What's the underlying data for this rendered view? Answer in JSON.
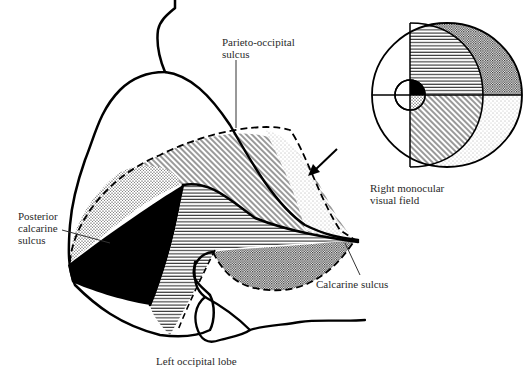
{
  "diagram": {
    "colors": {
      "ink": "#000000",
      "background": "#ffffff",
      "text": "#2a2a2a"
    },
    "labels": {
      "parieto_occipital": "Parieto-occipital\nsulcus",
      "right_monocular": "Right monocular\nvisual field",
      "posterior_calcarine": "Posterior\ncalcarine\nsulcus",
      "calcarine": "Calcarine sulcus",
      "left_occipital": "Left occipital lobe"
    },
    "patterns": [
      {
        "name": "macula-upper",
        "fill": "solid-black"
      },
      {
        "name": "macula-lower",
        "fill": "fine-dots"
      },
      {
        "name": "upper-quadrant-central",
        "fill": "horizontal-lines"
      },
      {
        "name": "lower-quadrant-central",
        "fill": "diagonal-lines"
      },
      {
        "name": "upper-quadrant-peripheral",
        "fill": "dense-crosshatch"
      },
      {
        "name": "lower-quadrant-peripheral",
        "fill": "light-stipple"
      }
    ],
    "visual_field": {
      "shape": "ellipse-with-central-circle",
      "quadrants": [
        "upper-left-blank",
        "upper-right",
        "lower-left-blank",
        "lower-right"
      ]
    }
  }
}
